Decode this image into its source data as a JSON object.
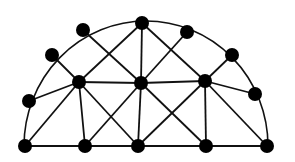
{
  "diagram": {
    "type": "semicircular-triangulated-graph",
    "colors": {
      "stroke": "#111111",
      "node": "#000000",
      "background": "#ffffff"
    },
    "node_radius": 7,
    "arc": {
      "cx": 146,
      "cy": 146,
      "rx": 122,
      "ry": 125
    },
    "nodes": [
      {
        "id": "A",
        "x": 25,
        "y": 146
      },
      {
        "id": "B",
        "x": 85,
        "y": 146
      },
      {
        "id": "C",
        "x": 138,
        "y": 146
      },
      {
        "id": "D",
        "x": 206,
        "y": 146
      },
      {
        "id": "E",
        "x": 267,
        "y": 146
      },
      {
        "id": "F",
        "x": 29,
        "y": 101
      },
      {
        "id": "G",
        "x": 52,
        "y": 55
      },
      {
        "id": "H",
        "x": 83,
        "y": 30
      },
      {
        "id": "I",
        "x": 142,
        "y": 23
      },
      {
        "id": "J",
        "x": 187,
        "y": 32
      },
      {
        "id": "K",
        "x": 232,
        "y": 55
      },
      {
        "id": "L",
        "x": 255,
        "y": 94
      },
      {
        "id": "M",
        "x": 79,
        "y": 82
      },
      {
        "id": "N",
        "x": 141,
        "y": 83
      },
      {
        "id": "O",
        "x": 205,
        "y": 81
      }
    ],
    "edges": [
      [
        "A",
        "B"
      ],
      [
        "B",
        "C"
      ],
      [
        "C",
        "D"
      ],
      [
        "D",
        "E"
      ],
      [
        "F",
        "M"
      ],
      [
        "G",
        "M"
      ],
      [
        "M",
        "N"
      ],
      [
        "N",
        "O"
      ],
      [
        "O",
        "K"
      ],
      [
        "O",
        "L"
      ],
      [
        "M",
        "B"
      ],
      [
        "N",
        "C"
      ],
      [
        "O",
        "D"
      ],
      [
        "A",
        "M"
      ],
      [
        "M",
        "C"
      ],
      [
        "C",
        "O"
      ],
      [
        "O",
        "E"
      ],
      [
        "B",
        "N"
      ],
      [
        "N",
        "D"
      ],
      [
        "H",
        "N"
      ],
      [
        "N",
        "J"
      ],
      [
        "I",
        "N"
      ],
      [
        "I",
        "M"
      ],
      [
        "I",
        "O"
      ]
    ]
  }
}
